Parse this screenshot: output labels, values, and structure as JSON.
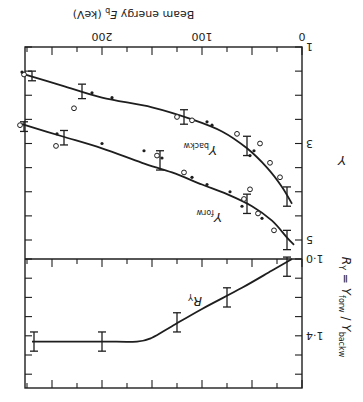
{
  "figure": {
    "rotation_deg": 180,
    "ink_color": "#1e1e1e",
    "background": "#ffffff"
  },
  "chart_data": [
    {
      "type": "line",
      "panel": "lower",
      "title": "",
      "xlabel": "Beam energy E_b (keV)",
      "xlabel_parts": {
        "main": "Beam energy ",
        "sym": "E",
        "sub": "b",
        "unit": " (keV)"
      },
      "ylabel": "Y",
      "xlim": [
        0,
        275
      ],
      "ylim": [
        1,
        5
      ],
      "x_tick_labels": [
        "0",
        "100",
        "200"
      ],
      "x_ticks": [
        0,
        25,
        50,
        75,
        100,
        125,
        150,
        175,
        200,
        225,
        250,
        275
      ],
      "y_tick_labels": [
        "1",
        "3",
        "5"
      ],
      "y_ticks": [
        1,
        1.5,
        2,
        2.5,
        3,
        3.5,
        4,
        4.5,
        5
      ],
      "grid": false,
      "series": [
        {
          "name": "Y_forw",
          "label": "Y",
          "label_sub": "forw",
          "curve": [
            [
              8,
              5.1
            ],
            [
              15,
              4.95
            ],
            [
              30,
              4.6
            ],
            [
              50,
              4.3
            ],
            [
              75,
              4.05
            ],
            [
              100,
              3.85
            ],
            [
              130,
              3.6
            ],
            [
              160,
              3.4
            ],
            [
              200,
              3.1
            ],
            [
              240,
              2.85
            ],
            [
              280,
              2.6
            ]
          ],
          "errorbars": [
            {
              "x": 15,
              "y": 5.0,
              "err": 0.2
            },
            {
              "x": 55,
              "y": 4.25,
              "err": 0.2
            },
            {
              "x": 142,
              "y": 3.35,
              "err": 0.2
            },
            {
              "x": 238,
              "y": 2.88,
              "err": 0.15
            },
            {
              "x": 278,
              "y": 2.65,
              "err": 0.1
            }
          ],
          "open_points": [
            [
              28,
              4.8
            ],
            [
              44,
              4.45
            ],
            [
              58,
              4.15
            ],
            [
              52,
              3.95
            ],
            [
              118,
              3.6
            ],
            [
              145,
              3.25
            ],
            [
              246,
              3.05
            ],
            [
              282,
              2.62
            ]
          ],
          "filled_points": [
            [
              40,
              4.55
            ],
            [
              60,
              4.3
            ],
            [
              72,
              4.0
            ],
            [
              95,
              3.85
            ],
            [
              110,
              3.7
            ],
            [
              140,
              3.3
            ],
            [
              158,
              3.15
            ],
            [
              200,
              3.0
            ],
            [
              245,
              2.8
            ]
          ]
        },
        {
          "name": "Y_backw",
          "label": "Y",
          "label_sub": "backw",
          "curve": [
            [
              10,
              4.25
            ],
            [
              20,
              3.9
            ],
            [
              35,
              3.5
            ],
            [
              55,
              3.1
            ],
            [
              80,
              2.75
            ],
            [
              110,
              2.5
            ],
            [
              150,
              2.25
            ],
            [
              200,
              2.05
            ],
            [
              240,
              1.8
            ],
            [
              280,
              1.55
            ]
          ],
          "errorbars": [
            {
              "x": 15,
              "y": 4.1,
              "err": 0.2
            },
            {
              "x": 55,
              "y": 3.05,
              "err": 0.2
            },
            {
              "x": 118,
              "y": 2.45,
              "err": 0.15
            },
            {
              "x": 220,
              "y": 1.92,
              "err": 0.15
            },
            {
              "x": 270,
              "y": 1.6,
              "err": 0.1
            }
          ],
          "open_points": [
            [
              22,
              3.7
            ],
            [
              32,
              3.4
            ],
            [
              42,
              3.0
            ],
            [
              65,
              2.8
            ],
            [
              110,
              2.52
            ],
            [
              125,
              2.45
            ],
            [
              228,
              2.27
            ],
            [
              278,
              1.57
            ]
          ],
          "filled_points": [
            [
              48,
              3.15
            ],
            [
              52,
              3.25
            ],
            [
              90,
              2.62
            ],
            [
              95,
              2.55
            ],
            [
              190,
              2.05
            ],
            [
              210,
              1.95
            ],
            [
              280,
              1.52
            ]
          ]
        }
      ]
    },
    {
      "type": "line",
      "panel": "upper",
      "title": "",
      "xlabel": "Beam energy E_b (keV)",
      "ylabel": "R_Y = Y_forw / Y_backw",
      "ylabel_parts": {
        "r": "R",
        "r_sub": "Y",
        "eq": " = ",
        "num": "Y",
        "num_sub": "forw",
        "slash": " / ",
        "den": "Y",
        "den_sub": "backw"
      },
      "xlim": [
        0,
        275
      ],
      "ylim": [
        1.0,
        1.65
      ],
      "x_ticks": [
        0,
        25,
        50,
        75,
        100,
        125,
        150,
        175,
        200,
        225,
        250,
        275
      ],
      "y_tick_labels": [
        "1·0",
        "1·4"
      ],
      "y_ticks": [
        1.0,
        1.1,
        1.2,
        1.3,
        1.4,
        1.5,
        1.6
      ],
      "grid": false,
      "series": [
        {
          "name": "R_Y",
          "label": "R",
          "label_sub": "Y",
          "curve": [
            [
              10,
              1.0
            ],
            [
              30,
              1.06
            ],
            [
              60,
              1.15
            ],
            [
              100,
              1.26
            ],
            [
              130,
              1.35
            ],
            [
              150,
              1.41
            ],
            [
              165,
              1.43
            ],
            [
              200,
              1.43
            ],
            [
              250,
              1.43
            ],
            [
              270,
              1.43
            ]
          ],
          "errorbars": [
            {
              "x": 15,
              "y": 1.04,
              "err": 0.05
            },
            {
              "x": 75,
              "y": 1.2,
              "err": 0.05
            },
            {
              "x": 125,
              "y": 1.33,
              "err": 0.05
            },
            {
              "x": 200,
              "y": 1.43,
              "err": 0.05
            },
            {
              "x": 268,
              "y": 1.43,
              "err": 0.05
            }
          ]
        }
      ]
    }
  ],
  "labels": {
    "x_axis_title": "Beam energy E_b (keV)",
    "lower_y_axis_title": "Y",
    "upper_y_axis_title": "R_Y = Y_forw / Y_backw",
    "curve_label_forw": "Y_forw",
    "curve_label_backw": "Y_backw",
    "curve_label_ratio": "R_Y",
    "tick_0": "0",
    "tick_100": "100",
    "tick_200": "200",
    "ytick_1": "1",
    "ytick_3": "3",
    "ytick_5": "5",
    "rtick_10": "1·0",
    "rtick_14": "1·4"
  }
}
